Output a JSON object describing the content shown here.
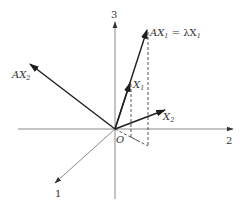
{
  "figure": {
    "origin_label": "O",
    "axes": [
      {
        "id": "1",
        "label": "1"
      },
      {
        "id": "2",
        "label": "2"
      },
      {
        "id": "3",
        "label": "3"
      }
    ],
    "vectors": [
      {
        "id": "X1",
        "base": "X",
        "sub": "1"
      },
      {
        "id": "AX1",
        "base": "AX",
        "sub": "1",
        "suffix": " = λX",
        "suffix_sub": "1"
      },
      {
        "id": "X2",
        "base": "X",
        "sub": "2"
      },
      {
        "id": "AX2",
        "base": "AX",
        "sub": "2"
      }
    ]
  },
  "labels": {
    "axis1": "1",
    "axis2": "2",
    "axis3": "3",
    "origin": "O",
    "x1_base": "X",
    "x1_sub": "1",
    "ax1_base": "AX",
    "ax1_sub": "1",
    "ax1_eq": " = λX",
    "ax1_eq_sub": "1",
    "x2_base": "X",
    "x2_sub": "2",
    "ax2_base": "AX",
    "ax2_sub": "2"
  },
  "colors": {
    "axis": "#8a8a8a",
    "vector": "#1e1e1e",
    "text": "#333333"
  }
}
